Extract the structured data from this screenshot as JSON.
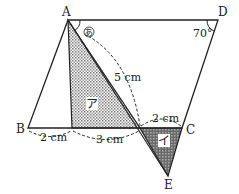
{
  "points": {
    "A": {
      "label": "A",
      "x": 68,
      "y": 20
    },
    "D": {
      "label": "D",
      "x": 218,
      "y": 20
    },
    "B": {
      "label": "B",
      "x": 28,
      "y": 128
    },
    "C": {
      "label": "C",
      "x": 182,
      "y": 128
    },
    "E": {
      "label": "E",
      "x": 168,
      "y": 176
    },
    "P": {
      "x": 72,
      "y": 128
    },
    "Q": {
      "x": 140,
      "y": 128
    }
  },
  "angles": {
    "a": {
      "label": "あ"
    },
    "d": {
      "label": "70°"
    }
  },
  "regions": {
    "a": {
      "label": "ア"
    },
    "i": {
      "label": "イ"
    }
  },
  "measurements": {
    "bp": "2 cm",
    "pq": "3 cm",
    "qc": "2 cm",
    "aq": "5 cm"
  },
  "colors": {
    "line": "#222222",
    "shade_light": "#bcbcbc",
    "shade_dark": "#8a8a8a"
  }
}
